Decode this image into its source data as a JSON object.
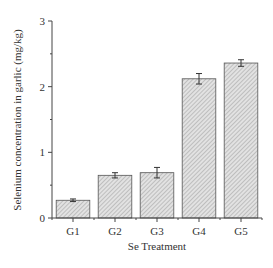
{
  "chart_data": {
    "type": "bar",
    "title": "",
    "xlabel": "Se Treatment",
    "ylabel": "Selenium concentration in garlic (mg/kg)",
    "categories": [
      "G1",
      "G2",
      "G3",
      "G4",
      "G5"
    ],
    "values": [
      0.27,
      0.65,
      0.69,
      2.12,
      2.36
    ],
    "errors": [
      0.02,
      0.04,
      0.08,
      0.08,
      0.05
    ],
    "ylim": [
      0,
      3
    ],
    "yticks": [
      "0",
      "1",
      "2",
      "3"
    ],
    "grid": false,
    "legend": null,
    "bar_fill": "hatched light gray"
  },
  "colors": {
    "axis": "#333333",
    "bar_fill": "#d9d9d9",
    "hatch": "#9a9a9a",
    "bar_edge": "#444444"
  }
}
